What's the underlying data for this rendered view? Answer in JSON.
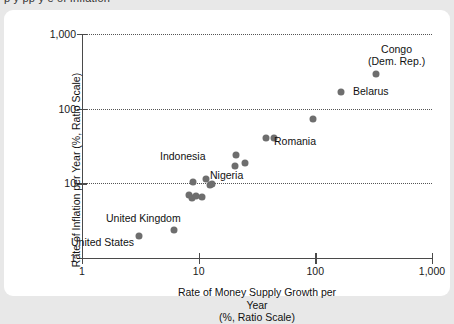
{
  "title_clipped": "p                     y   pp y                                          e      of Inflation",
  "chart_data": {
    "type": "scatter",
    "title": "",
    "xlabel_line1": "Rate of Money Supply Growth per Year",
    "xlabel_line2": "(%, Ratio Scale)",
    "ylabel": "Rate of Inflation per Year (%, Ratio Scale)",
    "xscale": "log",
    "yscale": "log",
    "xlim": [
      1,
      1000
    ],
    "ylim": [
      1,
      1000
    ],
    "xticks": [
      "1",
      "10",
      "100",
      "1,000"
    ],
    "xtick_values": [
      1,
      10,
      100,
      1000
    ],
    "yticks": [
      "1",
      "10",
      "100",
      "1,000"
    ],
    "ytick_values": [
      1,
      10,
      100,
      1000
    ],
    "grid": "horizontal-dotted",
    "legend": "none",
    "marker_color": "#6e6e6e",
    "points": [
      {
        "label": "United States",
        "x": 3.1,
        "y": 2.0,
        "label_pos": "below"
      },
      {
        "label": "United Kingdom",
        "x": 6.2,
        "y": 2.4,
        "label_pos": "above"
      },
      {
        "label": "",
        "x": 8.3,
        "y": 7.0
      },
      {
        "label": "",
        "x": 8.8,
        "y": 6.3
      },
      {
        "label": "",
        "x": 9.4,
        "y": 6.8
      },
      {
        "label": "",
        "x": 9.0,
        "y": 10.5
      },
      {
        "label": "",
        "x": 10.6,
        "y": 6.5
      },
      {
        "label": "Indonesia",
        "x": 11.5,
        "y": 11.5,
        "label_pos": "above-left"
      },
      {
        "label": "",
        "x": 12.4,
        "y": 9.5
      },
      {
        "label": "",
        "x": 13.0,
        "y": 9.8
      },
      {
        "label": "",
        "x": 20.5,
        "y": 17.0
      },
      {
        "label": "Nigeria",
        "x": 21.0,
        "y": 24.0,
        "label_pos": "below"
      },
      {
        "label": "",
        "x": 25.0,
        "y": 18.5
      },
      {
        "label": "",
        "x": 38.0,
        "y": 40.0
      },
      {
        "label": "Romania",
        "x": 44.0,
        "y": 41.0,
        "label_pos": "right"
      },
      {
        "label": "",
        "x": 96.0,
        "y": 72.0
      },
      {
        "label": "Belarus",
        "x": 165.0,
        "y": 168.0,
        "label_pos": "right"
      },
      {
        "label": "Congo (Dem. Rep.)",
        "x": 330.0,
        "y": 295.0,
        "label_pos": "above"
      }
    ],
    "annotations": [
      {
        "text": "Congo",
        "near": "Congo (Dem. Rep.)"
      },
      {
        "text": "(Dem. Rep.)",
        "near": "Congo (Dem. Rep.)"
      },
      {
        "text": "Belarus",
        "near": "Belarus"
      },
      {
        "text": "Romania",
        "near": "Romania"
      },
      {
        "text": "Nigeria",
        "near": "Nigeria"
      },
      {
        "text": "Indonesia",
        "near": "Indonesia"
      },
      {
        "text": "United Kingdom",
        "near": "United Kingdom"
      },
      {
        "text": "United States",
        "near": "United States"
      }
    ]
  },
  "labels": {
    "congo_l1": "Congo",
    "congo_l2": "(Dem. Rep.)",
    "belarus": "Belarus",
    "romania": "Romania",
    "nigeria": "Nigeria",
    "indonesia": "Indonesia",
    "uk": "United Kingdom",
    "us": "United States"
  },
  "axes": {
    "x_tick_1": "1",
    "x_tick_10": "10",
    "x_tick_100": "100",
    "x_tick_1000": "1,000",
    "y_tick_1": "1",
    "y_tick_10": "10",
    "y_tick_100": "100",
    "y_tick_1000": "1,000",
    "x_title_1": "Rate of Money Supply Growth per Year",
    "x_title_2": "(%, Ratio Scale)",
    "y_title": "Rate of Inflation per Year (%, Ratio Scale)"
  }
}
